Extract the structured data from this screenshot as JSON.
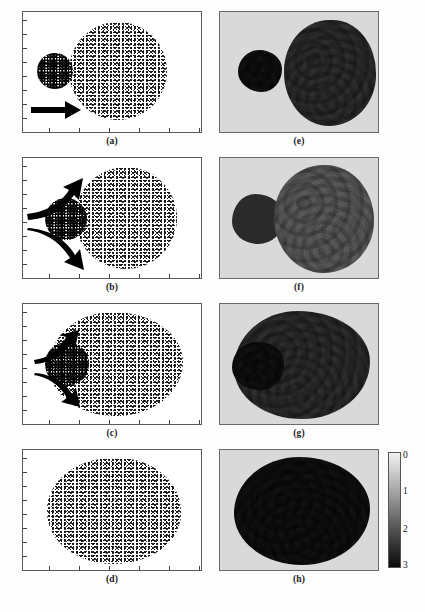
{
  "figure": {
    "type": "scientific-multipanel",
    "grid": {
      "rows": 4,
      "cols": 2
    },
    "left_column_description": "particle scatter snapshots on white background",
    "right_column_description": "grayscale density contour maps on light gray background"
  },
  "panels": [
    {
      "id": "a",
      "caption": "(a)",
      "column": "left",
      "row": 1,
      "background": "#ffffff",
      "objects": [
        {
          "name": "small-aggregate",
          "cx": 22,
          "cy": 48,
          "r": 17,
          "density": "dense"
        },
        {
          "name": "large-aggregate",
          "cx": 62,
          "cy": 50,
          "r": 37,
          "density": "sparse"
        }
      ],
      "arrows": [
        {
          "name": "straight-arrow",
          "style": "straight",
          "direction": "right"
        }
      ]
    },
    {
      "id": "b",
      "caption": "(b)",
      "column": "left",
      "row": 2,
      "background": "#ffffff",
      "objects": [
        {
          "name": "small-aggregate",
          "cx": 26,
          "cy": 50,
          "r": 16,
          "density": "dense"
        },
        {
          "name": "large-aggregate",
          "cx": 62,
          "cy": 50,
          "r": 37,
          "density": "sparse"
        }
      ],
      "arrows": [
        {
          "name": "curved-arrow-upper",
          "style": "curved",
          "direction": "upper-right"
        },
        {
          "name": "curved-arrow-lower",
          "style": "curved",
          "direction": "lower-right"
        }
      ]
    },
    {
      "id": "c",
      "caption": "(c)",
      "column": "left",
      "row": 3,
      "background": "#ffffff",
      "objects": [
        {
          "name": "merged-aggregate",
          "cx": 52,
          "cy": 50,
          "rx": 40,
          "ry": 36,
          "density": "sparse"
        },
        {
          "name": "dense-left-lobe",
          "cx": 22,
          "cy": 52,
          "r": 15,
          "density": "dense"
        }
      ],
      "arrows": [
        {
          "name": "curved-arrow-upper",
          "style": "curved-short",
          "direction": "upper-right"
        },
        {
          "name": "curved-arrow-lower",
          "style": "curved-short",
          "direction": "lower-right"
        }
      ]
    },
    {
      "id": "d",
      "caption": "(d)",
      "column": "left",
      "row": 4,
      "background": "#ffffff",
      "objects": [
        {
          "name": "merged-aggregate",
          "cx": 50,
          "cy": 50,
          "rx": 40,
          "ry": 37,
          "density": "sparse"
        }
      ],
      "arrows": []
    },
    {
      "id": "e",
      "caption": "(e)",
      "column": "right",
      "row": 1,
      "background": "#d9d9d9",
      "objects": [
        {
          "name": "small-density-blob",
          "cx": 21,
          "cy": 47,
          "r": 15,
          "level": "dark"
        },
        {
          "name": "large-density-blob",
          "cx": 61,
          "cy": 50,
          "r": 37,
          "level": "mid"
        }
      ]
    },
    {
      "id": "f",
      "caption": "(f)",
      "column": "right",
      "row": 2,
      "background": "#d9d9d9",
      "objects": [
        {
          "name": "small-density-blob",
          "cx": 19,
          "cy": 50,
          "r": 15,
          "level": "very-dark"
        },
        {
          "name": "large-density-blob",
          "cx": 60,
          "cy": 50,
          "r": 37,
          "level": "light"
        }
      ]
    },
    {
      "id": "g",
      "caption": "(g)",
      "column": "right",
      "row": 3,
      "background": "#d9d9d9",
      "objects": [
        {
          "name": "merged-density-blob",
          "cx": 50,
          "cy": 50,
          "rx": 42,
          "ry": 38,
          "level": "mid"
        },
        {
          "name": "dark-left-lobe",
          "cx": 20,
          "cy": 52,
          "r": 16,
          "level": "dark"
        }
      ]
    },
    {
      "id": "h",
      "caption": "(h)",
      "column": "right",
      "row": 4,
      "background": "#d9d9d9",
      "objects": [
        {
          "name": "merged-density-blob",
          "cx": 50,
          "cy": 50,
          "rx": 42,
          "ry": 38,
          "level": "dark"
        }
      ]
    }
  ],
  "colorbar": {
    "name": "density-colorbar",
    "orientation": "vertical",
    "scale": "grayscale",
    "top_color": "#f2f2f2",
    "bottom_color": "#0a0a0a",
    "min_label": "0",
    "max_label": "3",
    "ticks": [
      {
        "label": "0",
        "position_pct": 0
      },
      {
        "label": "1",
        "position_pct": 33.3
      },
      {
        "label": "2",
        "position_pct": 66.6
      },
      {
        "label": "3",
        "position_pct": 100
      }
    ]
  },
  "axes": {
    "left_column_ticks": {
      "y_count": 8,
      "x_count": 6,
      "labels_shown": false
    },
    "right_column_ticks": {
      "shown": false
    }
  },
  "colors": {
    "panel_border": "#5a5a5a",
    "left_background": "#ffffff",
    "right_background": "#d9d9d9",
    "caption_color": "#1a1a1a",
    "arrow_color": "#000000"
  }
}
